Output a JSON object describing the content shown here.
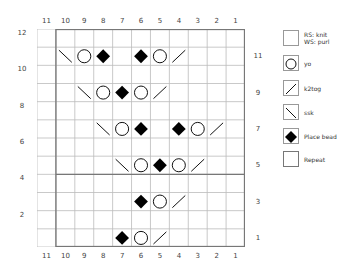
{
  "chart": {
    "columns": [
      "11",
      "10",
      "9",
      "8",
      "7",
      "6",
      "5",
      "4",
      "3",
      "2",
      "1"
    ],
    "left_row_labels": [
      "12",
      "10",
      "8",
      "6",
      "4",
      "2"
    ],
    "right_row_labels": [
      "11",
      "9",
      "7",
      "5",
      "3",
      "1"
    ],
    "rows": 12,
    "cols": 11,
    "repeat_border_col_after": 11,
    "repeat_border_row_between": "4-5",
    "stitches": [
      {
        "row": 11,
        "col": 10,
        "symbol": "ssk"
      },
      {
        "row": 11,
        "col": 9,
        "symbol": "yo"
      },
      {
        "row": 11,
        "col": 8,
        "symbol": "bead"
      },
      {
        "row": 11,
        "col": 6,
        "symbol": "bead"
      },
      {
        "row": 11,
        "col": 5,
        "symbol": "yo"
      },
      {
        "row": 11,
        "col": 4,
        "symbol": "k2tog"
      },
      {
        "row": 9,
        "col": 9,
        "symbol": "ssk"
      },
      {
        "row": 9,
        "col": 8,
        "symbol": "yo"
      },
      {
        "row": 9,
        "col": 7,
        "symbol": "bead"
      },
      {
        "row": 9,
        "col": 6,
        "symbol": "yo"
      },
      {
        "row": 9,
        "col": 5,
        "symbol": "k2tog"
      },
      {
        "row": 7,
        "col": 8,
        "symbol": "ssk"
      },
      {
        "row": 7,
        "col": 7,
        "symbol": "yo"
      },
      {
        "row": 7,
        "col": 6,
        "symbol": "bead"
      },
      {
        "row": 7,
        "col": 4,
        "symbol": "bead"
      },
      {
        "row": 7,
        "col": 3,
        "symbol": "yo"
      },
      {
        "row": 7,
        "col": 2,
        "symbol": "k2tog"
      },
      {
        "row": 5,
        "col": 7,
        "symbol": "ssk"
      },
      {
        "row": 5,
        "col": 6,
        "symbol": "yo"
      },
      {
        "row": 5,
        "col": 5,
        "symbol": "bead"
      },
      {
        "row": 5,
        "col": 4,
        "symbol": "yo"
      },
      {
        "row": 5,
        "col": 3,
        "symbol": "k2tog"
      },
      {
        "row": 3,
        "col": 6,
        "symbol": "bead"
      },
      {
        "row": 3,
        "col": 5,
        "symbol": "yo"
      },
      {
        "row": 3,
        "col": 4,
        "symbol": "k2tog"
      },
      {
        "row": 1,
        "col": 7,
        "symbol": "bead"
      },
      {
        "row": 1,
        "col": 6,
        "symbol": "yo"
      },
      {
        "row": 1,
        "col": 5,
        "symbol": "k2tog"
      }
    ]
  },
  "legend": [
    {
      "symbol": "knit",
      "label_line1": "RS: knit",
      "label_line2": "WS: purl"
    },
    {
      "symbol": "yo",
      "label_line1": "yo"
    },
    {
      "symbol": "k2tog",
      "label_line1": "k2tog"
    },
    {
      "symbol": "ssk",
      "label_line1": "ssk"
    },
    {
      "symbol": "bead",
      "label_line1": "Place bead"
    },
    {
      "symbol": "repeat",
      "label_line1": "Repeat"
    }
  ]
}
